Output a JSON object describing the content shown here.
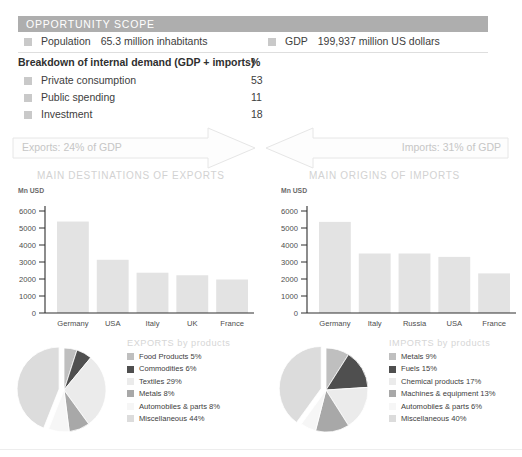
{
  "header": {
    "title": "OPPORTUNITY SCOPE"
  },
  "key_facts": [
    {
      "marker": "square-bullet-icon",
      "label": "Population",
      "value": "65.3 million inhabitants"
    },
    {
      "marker": "square-bullet-icon",
      "label": "GDP",
      "value": "199,937 million US dollars"
    }
  ],
  "breakdown": {
    "heading": "Breakdown of internal demand (GDP + imports)",
    "unit": "%",
    "rows": [
      {
        "label": "Private consumption",
        "value": "53"
      },
      {
        "label": "Public spending",
        "value": "11"
      },
      {
        "label": "Investment",
        "value": "18"
      }
    ]
  },
  "flows": {
    "exports": {
      "text": "Exports: 24% of GDP",
      "icon": "arrow-right-icon"
    },
    "imports": {
      "text": "Imports: 31% of GDP",
      "icon": "arrow-left-icon"
    }
  },
  "sections": {
    "exports_title": "MAIN DESTINATIONS OF EXPORTS",
    "imports_title": "MAIN ORIGINS OF IMPORTS"
  },
  "colors": {
    "header_band": "#aeaeae",
    "bar_fill": "#e3e3e3",
    "axis": "#2f2f2f",
    "muted_text": "#d2d2d2"
  },
  "chart_data": [
    {
      "type": "bar",
      "title": "MAIN DESTINATIONS OF EXPORTS",
      "xlabel": "",
      "ylabel": "Mn USD",
      "categories": [
        "Germany",
        "USA",
        "Italy",
        "UK",
        "France"
      ],
      "values": [
        5380,
        3130,
        2370,
        2220,
        1970
      ],
      "ylim": [
        0,
        6000
      ],
      "yticks": [
        0,
        1000,
        2000,
        3000,
        4000,
        5000,
        6000
      ],
      "ytick_labels": [
        "0",
        "1000",
        "2000",
        "3000",
        "4000",
        "5000",
        "6000"
      ],
      "grid": false,
      "legend": "none"
    },
    {
      "type": "bar",
      "title": "MAIN ORIGINS OF IMPORTS",
      "xlabel": "",
      "ylabel": "Mn USD",
      "categories": [
        "Germany",
        "Italy",
        "Russia",
        "USA",
        "France"
      ],
      "values": [
        5360,
        3500,
        3500,
        3300,
        2330
      ],
      "ylim": [
        0,
        6000
      ],
      "yticks": [
        0,
        1000,
        2000,
        3000,
        4000,
        5000,
        6000
      ],
      "ytick_labels": [
        "0",
        "1000",
        "2000",
        "3000",
        "4000",
        "5000",
        "6000"
      ],
      "grid": false,
      "legend": "none"
    },
    {
      "type": "pie",
      "title": "EXPORTS by products",
      "legend_position": "right",
      "labels": [
        "Food Products 5%",
        "Commodities 6%",
        "Textiles 29%",
        "Metals 8%",
        "Automobiles & parts 8%",
        "Miscellaneous 44%"
      ],
      "categories": [
        "Food Products",
        "Commodities",
        "Textiles",
        "Metals",
        "Automobiles & parts",
        "Miscellaneous"
      ],
      "values": [
        5,
        6,
        29,
        8,
        8,
        44
      ],
      "colors": [
        "#bfbfbf",
        "#4f4f4f",
        "#ebebeb",
        "#a8a8a8",
        "#f6f6f6",
        "#dcdcdc"
      ],
      "exploded_slice": "Miscellaneous"
    },
    {
      "type": "pie",
      "title": "IMPORTS by products",
      "legend_position": "right",
      "labels": [
        "Metals 9%",
        "Fuels 15%",
        "Chemical products 17%",
        "Machines & equipment 13%",
        "Automobiles & parts 6%",
        "Miscellaneous 40%"
      ],
      "categories": [
        "Metals",
        "Fuels",
        "Chemical products",
        "Machines & equipment",
        "Automobiles & parts",
        "Miscellaneous"
      ],
      "values": [
        9,
        15,
        17,
        13,
        6,
        40
      ],
      "colors": [
        "#bfbfbf",
        "#4f4f4f",
        "#ebebeb",
        "#a8a8a8",
        "#f6f6f6",
        "#dcdcdc"
      ],
      "exploded_slice": "Miscellaneous"
    }
  ]
}
